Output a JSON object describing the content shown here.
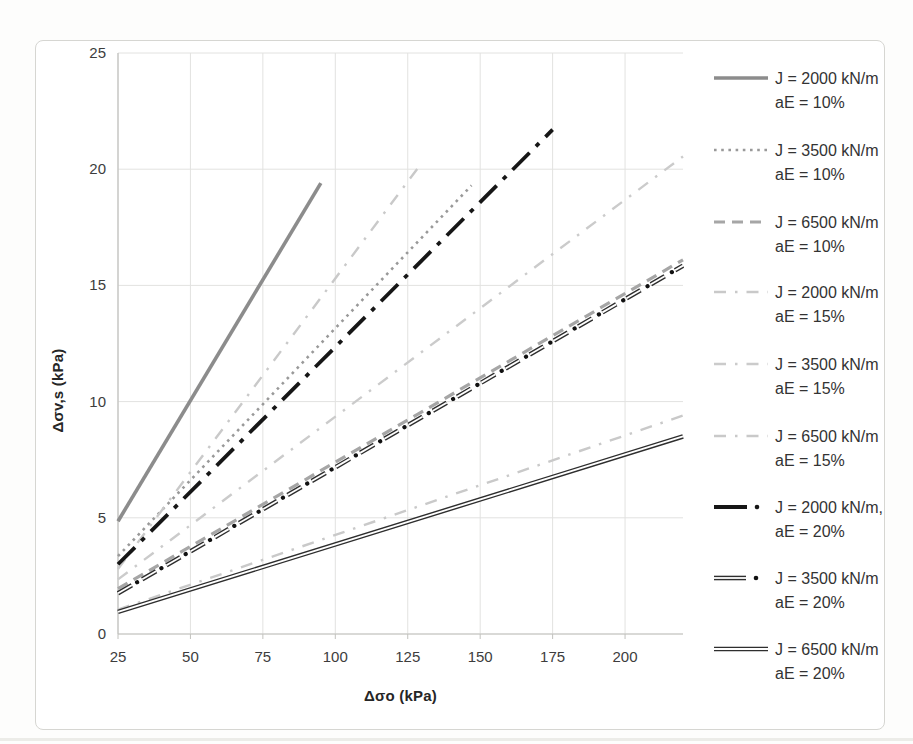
{
  "figure": {
    "background": "#ffffff",
    "border_color": "#d6d6d2"
  },
  "chart_data": {
    "type": "line",
    "title": "",
    "xlabel": "Δσo (kPa)",
    "ylabel": "Δσv,s (kPa)",
    "xlim": [
      25,
      220
    ],
    "ylim": [
      0,
      25
    ],
    "xticks": [
      25,
      50,
      75,
      100,
      125,
      150,
      175,
      200
    ],
    "yticks": [
      0,
      5,
      10,
      15,
      20,
      25
    ],
    "grid": true,
    "legend_position": "right",
    "colors": {
      "grid": "#e2e2e0",
      "axis": "#c2c2be",
      "tick_text": "#3d3d3d",
      "legend_text": "#333333"
    },
    "series": [
      {
        "label_line1": "J = 2000 kN/m",
        "label_line2": "aE = 10%",
        "J_kN_per_m": 2000,
        "aE_percent": 10,
        "style": "solid-gray",
        "color": "#8c8c8c",
        "points": [
          [
            25,
            4.85
          ],
          [
            95,
            19.4
          ]
        ]
      },
      {
        "label_line1": "J = 3500 kN/m",
        "label_line2": "aE = 10%",
        "J_kN_per_m": 3500,
        "aE_percent": 10,
        "style": "dotted-gray",
        "color": "#999999",
        "points": [
          [
            25,
            3.35
          ],
          [
            147,
            19.3
          ]
        ]
      },
      {
        "label_line1": "J = 6500 kN/m",
        "label_line2": "aE = 10%",
        "J_kN_per_m": 6500,
        "aE_percent": 10,
        "style": "dashed-gray",
        "color": "#a6a6a6",
        "points": [
          [
            25,
            1.95
          ],
          [
            220,
            16.1
          ]
        ]
      },
      {
        "label_line1": "J = 2000 kN/m",
        "label_line2": "aE = 15%",
        "J_kN_per_m": 2000,
        "aE_percent": 15,
        "style": "light-dash-dot",
        "color": "#c9c9c9",
        "points": [
          [
            25,
            2.8
          ],
          [
            130,
            20.3
          ]
        ]
      },
      {
        "label_line1": "J = 3500 kN/m",
        "label_line2": "aE = 15%",
        "J_kN_per_m": 3500,
        "aE_percent": 15,
        "style": "light-dash-dot",
        "color": "#cbcbcb",
        "points": [
          [
            25,
            2.35
          ],
          [
            220,
            20.55
          ]
        ]
      },
      {
        "label_line1": "J = 6500 kN/m",
        "label_line2": "aE = 15%",
        "J_kN_per_m": 6500,
        "aE_percent": 15,
        "style": "light-dash-dot",
        "color": "#c9c9c9",
        "points": [
          [
            25,
            1.05
          ],
          [
            220,
            9.4
          ]
        ]
      },
      {
        "label_line1": "J = 2000 kN/m,",
        "label_line2": "aE = 20%",
        "J_kN_per_m": 2000,
        "aE_percent": 20,
        "style": "black-dash-dot",
        "color": "#161616",
        "points": [
          [
            25,
            3.0
          ],
          [
            175,
            21.7
          ]
        ]
      },
      {
        "label_line1": "J = 3500 kN/m",
        "label_line2": "aE = 20%",
        "J_kN_per_m": 3500,
        "aE_percent": 20,
        "style": "hollow-dash-dot",
        "color": "#2e2e2e",
        "points": [
          [
            25,
            1.75
          ],
          [
            220,
            15.85
          ]
        ]
      },
      {
        "label_line1": "J = 6500 kN/m",
        "label_line2": "aE = 20%",
        "J_kN_per_m": 6500,
        "aE_percent": 20,
        "style": "hollow-solid",
        "color": "#2e2e2e",
        "points": [
          [
            25,
            0.95
          ],
          [
            220,
            8.5
          ]
        ]
      }
    ]
  }
}
